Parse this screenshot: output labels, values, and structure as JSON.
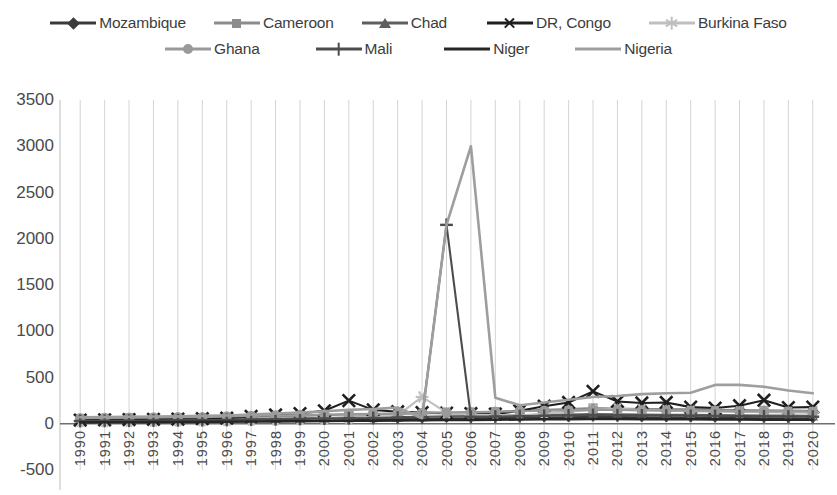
{
  "chart_data": {
    "type": "line",
    "title": "",
    "subtitle": "",
    "xlabel": "",
    "ylabel": "",
    "grid": "vertical-only",
    "legend_position": "top",
    "ylim": [
      -500,
      3500
    ],
    "yticks": [
      3500,
      3000,
      2500,
      2000,
      1500,
      1000,
      500,
      0,
      -500
    ],
    "ytick_labels": [
      "3500",
      "3000",
      "2500",
      "2000",
      "1500",
      "1000",
      "500",
      "0",
      "-500"
    ],
    "x": [
      1990,
      1991,
      1992,
      1993,
      1994,
      1995,
      1996,
      1997,
      1998,
      1999,
      2000,
      2001,
      2002,
      2003,
      2004,
      2005,
      2006,
      2007,
      2008,
      2009,
      2010,
      2011,
      2012,
      2013,
      2014,
      2015,
      2016,
      2017,
      2018,
      2019,
      2020
    ],
    "xtick_labels": [
      "1990",
      "1991",
      "1992",
      "1993",
      "1994",
      "1995",
      "1996",
      "1997",
      "1998",
      "1999",
      "2000",
      "2001",
      "2002",
      "2003",
      "2004",
      "2005",
      "2006",
      "2007",
      "2008",
      "2009",
      "2010",
      "2011",
      "2012",
      "2013",
      "2014",
      "2015",
      "2016",
      "2017",
      "2018",
      "2019",
      "2020"
    ],
    "series": [
      {
        "name": "Mozambique",
        "marker": "diamond",
        "color": "#3a3a3a",
        "values": [
          20,
          22,
          25,
          24,
          26,
          28,
          30,
          35,
          38,
          40,
          45,
          50,
          48,
          52,
          55,
          58,
          60,
          62,
          65,
          68,
          70,
          75,
          72,
          70,
          68,
          66,
          64,
          62,
          60,
          58,
          55
        ]
      },
      {
        "name": "Cameroon",
        "marker": "square",
        "color": "#8c8c8c",
        "values": [
          55,
          58,
          62,
          60,
          64,
          66,
          70,
          75,
          80,
          85,
          92,
          100,
          98,
          105,
          110,
          118,
          125,
          130,
          140,
          150,
          160,
          170,
          165,
          160,
          158,
          155,
          150,
          148,
          145,
          142,
          140
        ]
      },
      {
        "name": "Chad",
        "marker": "triangle",
        "color": "#5e5e5e",
        "values": [
          35,
          36,
          38,
          40,
          42,
          44,
          46,
          50,
          54,
          58,
          62,
          66,
          68,
          72,
          76,
          80,
          84,
          88,
          92,
          96,
          100,
          105,
          102,
          100,
          98,
          96,
          94,
          92,
          90,
          88,
          86
        ]
      },
      {
        "name": "DR, Congo",
        "marker": "x",
        "color": "#1f1f1f",
        "values": [
          40,
          42,
          45,
          48,
          50,
          55,
          60,
          80,
          95,
          110,
          140,
          250,
          150,
          130,
          120,
          115,
          110,
          105,
          140,
          190,
          230,
          350,
          240,
          225,
          230,
          180,
          170,
          195,
          255,
          175,
          180
        ]
      },
      {
        "name": "Burkina Faso",
        "marker": "star",
        "color": "#bfbfbf",
        "values": [
          25,
          26,
          28,
          30,
          32,
          34,
          36,
          40,
          44,
          48,
          55,
          60,
          70,
          90,
          290,
          120,
          100,
          95,
          90,
          110,
          130,
          150,
          160,
          150,
          140,
          135,
          130,
          128,
          125,
          122,
          120
        ]
      },
      {
        "name": "Ghana",
        "marker": "circle",
        "color": "#9a9a9a",
        "values": [
          60,
          62,
          65,
          68,
          70,
          72,
          78,
          85,
          90,
          95,
          100,
          105,
          108,
          112,
          118,
          122,
          126,
          130,
          135,
          140,
          145,
          150,
          148,
          145,
          142,
          140,
          138,
          136,
          134,
          132,
          130
        ]
      },
      {
        "name": "Mali",
        "marker": "plus",
        "color": "#4d4d4d",
        "values": [
          30,
          31,
          33,
          35,
          37,
          39,
          41,
          45,
          48,
          52,
          56,
          60,
          62,
          66,
          70,
          2150,
          74,
          78,
          82,
          86,
          90,
          95,
          92,
          90,
          88,
          86,
          84,
          82,
          80,
          78,
          76
        ]
      },
      {
        "name": "Niger",
        "marker": "none",
        "color": "#262626",
        "values": [
          15,
          16,
          17,
          18,
          19,
          20,
          22,
          24,
          26,
          28,
          30,
          32,
          34,
          36,
          38,
          40,
          42,
          44,
          46,
          48,
          50,
          52,
          51,
          50,
          49,
          48,
          47,
          46,
          45,
          44,
          43
        ]
      },
      {
        "name": "Nigeria",
        "marker": "none",
        "color": "#9e9e9e",
        "values": [
          70,
          72,
          75,
          78,
          80,
          85,
          90,
          100,
          110,
          120,
          135,
          150,
          160,
          175,
          60,
          2150,
          3000,
          280,
          200,
          230,
          260,
          290,
          300,
          320,
          330,
          335,
          420,
          420,
          400,
          360,
          330
        ]
      }
    ]
  }
}
